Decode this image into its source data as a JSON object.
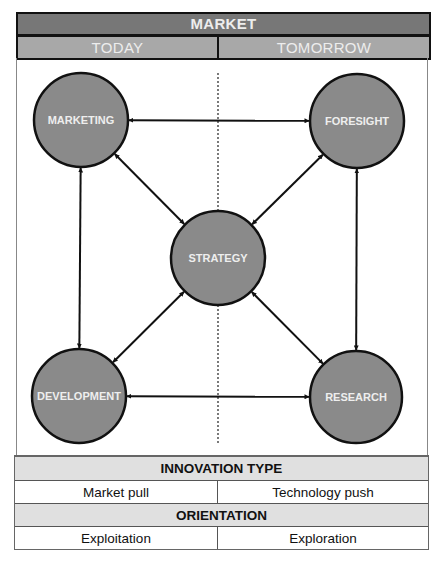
{
  "header": {
    "title": "MARKET",
    "columns": [
      "TODAY",
      "TOMORROW"
    ]
  },
  "diagram": {
    "nodes": [
      {
        "id": "marketing",
        "label": "MARKETING",
        "cx": 81,
        "cy": 120,
        "r": 47
      },
      {
        "id": "foresight",
        "label": "FORESIGHT",
        "cx": 357,
        "cy": 121,
        "r": 47
      },
      {
        "id": "strategy",
        "label": "STRATEGY",
        "cx": 218,
        "cy": 258,
        "r": 47
      },
      {
        "id": "development",
        "label": "DEVELOPMENT",
        "cx": 79,
        "cy": 396,
        "r": 47
      },
      {
        "id": "research",
        "label": "RESEARCH",
        "cx": 356,
        "cy": 397,
        "r": 46
      }
    ],
    "edges": [
      {
        "from": "marketing",
        "to": "foresight",
        "type": "bidirectional"
      },
      {
        "from": "marketing",
        "to": "development",
        "type": "bidirectional"
      },
      {
        "from": "marketing",
        "to": "strategy",
        "type": "bidirectional"
      },
      {
        "from": "foresight",
        "to": "strategy",
        "type": "bidirectional"
      },
      {
        "from": "foresight",
        "to": "research",
        "type": "bidirectional"
      },
      {
        "from": "development",
        "to": "strategy",
        "type": "bidirectional"
      },
      {
        "from": "development",
        "to": "research",
        "type": "bidirectional"
      },
      {
        "from": "research",
        "to": "strategy",
        "type": "bidirectional"
      }
    ],
    "divider": {
      "style": "dotted",
      "x": 218,
      "y1": 73,
      "y2": 443
    },
    "colors": {
      "node_fill": "#8a8a8a",
      "node_stroke": "#111111",
      "label": "#eeeeee",
      "edge": "#111111"
    }
  },
  "table": {
    "innovation_type": {
      "heading": "INNOVATION TYPE",
      "left": "Market pull",
      "right": "Technology push"
    },
    "orientation": {
      "heading": "ORIENTATION",
      "left": "Exploitation",
      "right": "Exploration"
    }
  }
}
